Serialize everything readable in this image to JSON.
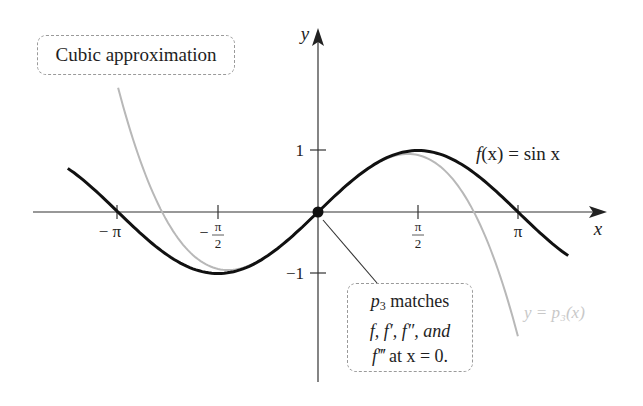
{
  "chart_data": {
    "type": "line",
    "title": "",
    "xlabel": "x",
    "ylabel": "y",
    "xlim": [
      -4.9,
      4.5
    ],
    "ylim": [
      -2.75,
      2.95
    ],
    "grid": false,
    "legend_position": "inline labels",
    "x_ticks": [
      {
        "value": -3.14159,
        "label": "−π"
      },
      {
        "value": -1.5708,
        "label": "−π/2"
      },
      {
        "value": 1.5708,
        "label": "π/2"
      },
      {
        "value": 3.14159,
        "label": "π"
      }
    ],
    "y_ticks": [
      {
        "value": 1,
        "label": "1"
      },
      {
        "value": -1,
        "label": "−1"
      }
    ],
    "series": [
      {
        "name": "f(x) = sin x",
        "expression": "sin(x)",
        "color": "#111111",
        "x_range": [
          -3.93,
          3.93
        ],
        "x": [
          -3.93,
          -3.14,
          -2.36,
          -1.57,
          -0.79,
          0,
          0.79,
          1.57,
          2.36,
          3.14,
          3.93
        ],
        "values": [
          0.71,
          0.0,
          -0.71,
          -1.0,
          -0.71,
          0.0,
          0.71,
          1.0,
          0.71,
          0.0,
          -0.71
        ]
      },
      {
        "name": "y = p3(x)",
        "expression": "x - x^3/6",
        "color": "#b8b8b8",
        "x_range": [
          -3.14,
          3.14
        ],
        "x": [
          -3.14,
          -2.36,
          -1.57,
          -0.79,
          0,
          0.79,
          1.57,
          2.36,
          3.14
        ],
        "values": [
          2.03,
          -0.17,
          -0.92,
          -0.71,
          0.0,
          0.71,
          0.92,
          0.17,
          -2.03
        ]
      }
    ],
    "points": [
      {
        "x": 0,
        "y": 0,
        "label": "origin match point"
      }
    ],
    "annotations": [
      "Cubic approximation",
      "p3 matches f, f′, f″, and f‴ at x = 0."
    ]
  },
  "labels": {
    "x_axis": "x",
    "y_axis": "y",
    "tick_neg_pi": "− π",
    "tick_neg_half_pi_num": "π",
    "tick_neg_half_pi_den": "2",
    "tick_neg_half_pi_sign": "−",
    "tick_half_pi_num": "π",
    "tick_half_pi_den": "2",
    "tick_pi": "π",
    "tick_y_pos1": "1",
    "tick_y_neg1": "−1",
    "sine_label_f": "f",
    "sine_label_rest": "(x) = sin x",
    "p3_label": "y = p₃(x)"
  },
  "callouts": {
    "cubic": "Cubic approximation",
    "match_line1_p": "p",
    "match_line1_sub": "3",
    "match_line1_rest": " matches",
    "match_line2": "f, f′, f″, and",
    "match_line3_f": "f‴",
    "match_line3_rest": " at x = 0."
  },
  "colors": {
    "sine": "#111111",
    "cubic": "#b8b8b8",
    "axes": "#333333",
    "p3_label": "#c8c8c8"
  }
}
